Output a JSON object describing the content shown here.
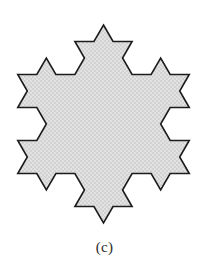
{
  "figure": {
    "caption": "(c)",
    "shape_name": "koch-snowflake",
    "iteration": 2,
    "fill_color": "#dcdcdc",
    "stroke_color": "#1c1c1c",
    "background_color": "#ffffff",
    "stroke_width": 1.6,
    "geometry": {
      "center_x": 103.5,
      "center_y": 124.0,
      "circumradius": 99.0,
      "base_triangle_side": 171.5,
      "bounds": {
        "x_min": 17,
        "x_max": 190,
        "y_min": 25,
        "y_max": 222
      },
      "orientation_degrees": -90,
      "segments_per_original_side": 16,
      "total_vertices": 48
    }
  },
  "chart_data": {
    "type": "diagram",
    "title": "(c)",
    "shape": "koch-snowflake",
    "iteration": 2,
    "sides": 48,
    "fill": "#dcdcdc",
    "stroke": "#1c1c1c"
  }
}
